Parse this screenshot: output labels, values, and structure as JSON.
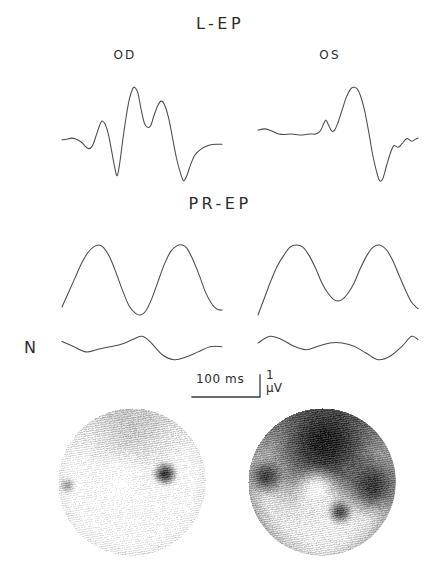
{
  "figure": {
    "sections": {
      "lep_title": "L-EP",
      "prep_title": "PR-EP",
      "noise_label": "N"
    },
    "eye_labels": {
      "right_eye": "OD",
      "left_eye": "OS"
    },
    "scale_bar": {
      "time_label": "100 ms",
      "amplitude_value": "1",
      "amplitude_unit": "µV"
    },
    "colors": {
      "trace": "#4a4a4a",
      "text": "#2b2b2b",
      "map_dark": "#111111",
      "map_light": "#f2f2f2"
    }
  },
  "chart_data": {
    "type": "line",
    "xlabel": "time",
    "ylabel": "amplitude",
    "axis_scale": {
      "time_per_bar_ms": 100,
      "amplitude_per_bar_uv": 1,
      "grid": false,
      "legend": false
    },
    "panels": [
      {
        "row": "L-EP",
        "eye": "OD",
        "description": "Large biphasic response with prominent positive peaks and deep negative troughs",
        "points": [
          [
            0,
            0.1
          ],
          [
            6,
            0.12
          ],
          [
            12,
            0.16
          ],
          [
            18,
            0.12
          ],
          [
            24,
            0.02
          ],
          [
            28,
            -0.1
          ],
          [
            33,
            -0.22
          ],
          [
            38,
            -0.12
          ],
          [
            43,
            0.28
          ],
          [
            47,
            0.62
          ],
          [
            50,
            0.78
          ],
          [
            54,
            0.66
          ],
          [
            58,
            0.3
          ],
          [
            62,
            -0.3
          ],
          [
            66,
            -0.92
          ],
          [
            69,
            -1.2
          ],
          [
            72,
            -0.78
          ],
          [
            76,
            0.1
          ],
          [
            80,
            0.9
          ],
          [
            84,
            1.55
          ],
          [
            88,
            1.92
          ],
          [
            91,
            2.0
          ],
          [
            95,
            1.78
          ],
          [
            99,
            1.18
          ],
          [
            103,
            0.7
          ],
          [
            107,
            0.55
          ],
          [
            111,
            0.62
          ],
          [
            115,
            0.98
          ],
          [
            120,
            1.35
          ],
          [
            124,
            1.5
          ],
          [
            128,
            1.38
          ],
          [
            133,
            0.92
          ],
          [
            138,
            0.2
          ],
          [
            143,
            -0.55
          ],
          [
            148,
            -1.1
          ],
          [
            152,
            -1.38
          ],
          [
            156,
            -1.2
          ],
          [
            161,
            -0.78
          ],
          [
            166,
            -0.46
          ],
          [
            172,
            -0.28
          ],
          [
            178,
            -0.16
          ],
          [
            186,
            -0.08
          ],
          [
            194,
            -0.06
          ],
          [
            200,
            -0.06
          ]
        ]
      },
      {
        "row": "L-EP",
        "eye": "OS",
        "description": "Attenuated and delayed response: flat early segment, small notch, single broad positive peak then deep negative trough",
        "points": [
          [
            0,
            0.06
          ],
          [
            8,
            0.1
          ],
          [
            14,
            0.06
          ],
          [
            20,
            -0.02
          ],
          [
            26,
            -0.1
          ],
          [
            33,
            -0.12
          ],
          [
            40,
            -0.1
          ],
          [
            47,
            -0.12
          ],
          [
            54,
            -0.14
          ],
          [
            60,
            -0.12
          ],
          [
            66,
            -0.1
          ],
          [
            72,
            -0.1
          ],
          [
            78,
            0.02
          ],
          [
            82,
            0.3
          ],
          [
            85,
            0.44
          ],
          [
            88,
            0.26
          ],
          [
            92,
            0.02
          ],
          [
            96,
            0.06
          ],
          [
            100,
            0.35
          ],
          [
            105,
            0.82
          ],
          [
            110,
            1.3
          ],
          [
            115,
            1.62
          ],
          [
            119,
            1.72
          ],
          [
            124,
            1.66
          ],
          [
            128,
            1.4
          ],
          [
            133,
            0.85
          ],
          [
            138,
            0.05
          ],
          [
            143,
            -0.85
          ],
          [
            148,
            -1.55
          ],
          [
            152,
            -1.92
          ],
          [
            156,
            -1.84
          ],
          [
            161,
            -1.3
          ],
          [
            166,
            -0.8
          ],
          [
            170,
            -0.55
          ],
          [
            175,
            -0.62
          ],
          [
            180,
            -0.48
          ],
          [
            186,
            -0.28
          ],
          [
            192,
            -0.38
          ],
          [
            197,
            -0.3
          ],
          [
            200,
            -0.26
          ]
        ]
      },
      {
        "row": "PR-EP",
        "eye": "OD",
        "description": "Large amplitude sinusoidal response with two well-formed positive peaks",
        "points": [
          [
            0,
            -0.85
          ],
          [
            8,
            -0.4
          ],
          [
            16,
            0.05
          ],
          [
            24,
            0.5
          ],
          [
            32,
            0.85
          ],
          [
            40,
            1.05
          ],
          [
            46,
            1.1
          ],
          [
            52,
            1.02
          ],
          [
            60,
            0.7
          ],
          [
            68,
            0.2
          ],
          [
            76,
            -0.35
          ],
          [
            84,
            -0.82
          ],
          [
            92,
            -1.05
          ],
          [
            98,
            -1.1
          ],
          [
            104,
            -1.0
          ],
          [
            112,
            -0.6
          ],
          [
            120,
            -0.05
          ],
          [
            128,
            0.5
          ],
          [
            136,
            0.9
          ],
          [
            144,
            1.08
          ],
          [
            150,
            1.1
          ],
          [
            156,
            1.0
          ],
          [
            164,
            0.62
          ],
          [
            172,
            0.12
          ],
          [
            180,
            -0.42
          ],
          [
            188,
            -0.78
          ],
          [
            194,
            -0.92
          ],
          [
            200,
            -0.95
          ]
        ]
      },
      {
        "row": "PR-EP",
        "eye": "OS",
        "description": "Markedly reduced amplitude, flattened double-hump waveform",
        "points": [
          [
            0,
            -0.52
          ],
          [
            8,
            -0.36
          ],
          [
            16,
            -0.2
          ],
          [
            24,
            -0.06
          ],
          [
            32,
            0.04
          ],
          [
            40,
            0.12
          ],
          [
            48,
            0.14
          ],
          [
            56,
            0.12
          ],
          [
            64,
            0.04
          ],
          [
            72,
            -0.08
          ],
          [
            80,
            -0.22
          ],
          [
            88,
            -0.32
          ],
          [
            96,
            -0.38
          ],
          [
            104,
            -0.38
          ],
          [
            112,
            -0.32
          ],
          [
            120,
            -0.22
          ],
          [
            128,
            -0.08
          ],
          [
            136,
            0.04
          ],
          [
            144,
            0.12
          ],
          [
            152,
            0.14
          ],
          [
            160,
            0.1
          ],
          [
            168,
            0.0
          ],
          [
            176,
            -0.14
          ],
          [
            184,
            -0.28
          ],
          [
            192,
            -0.4
          ],
          [
            200,
            -0.46
          ]
        ]
      },
      {
        "row": "N",
        "eye": "OD",
        "description": "Noise baseline, essentially flat",
        "points": [
          [
            0,
            0.04
          ],
          [
            15,
            0.02
          ],
          [
            30,
            0.0
          ],
          [
            45,
            0.01
          ],
          [
            60,
            0.02
          ],
          [
            75,
            0.03
          ],
          [
            90,
            0.05
          ],
          [
            100,
            0.06
          ],
          [
            110,
            0.04
          ],
          [
            125,
            -0.01
          ],
          [
            140,
            -0.03
          ],
          [
            155,
            -0.02
          ],
          [
            170,
            0.0
          ],
          [
            185,
            0.02
          ],
          [
            200,
            0.02
          ]
        ]
      },
      {
        "row": "N",
        "eye": "OS",
        "description": "Noise baseline, essentially flat",
        "points": [
          [
            0,
            0.02
          ],
          [
            15,
            0.04
          ],
          [
            30,
            0.03
          ],
          [
            45,
            0.01
          ],
          [
            60,
            0.0
          ],
          [
            75,
            0.01
          ],
          [
            90,
            0.02
          ],
          [
            105,
            0.02
          ],
          [
            120,
            0.01
          ],
          [
            135,
            -0.01
          ],
          [
            150,
            -0.03
          ],
          [
            165,
            -0.02
          ],
          [
            180,
            0.01
          ],
          [
            192,
            0.04
          ],
          [
            200,
            0.03
          ]
        ]
      }
    ],
    "field_maps": [
      {
        "eye": "OD",
        "type": "heatmap",
        "shape": "circular",
        "description": "Mostly light/preserved field with fine dither; discrete dark blind spot in the temporal (right) mid-periphery and mild darkening along the superior and outer rim",
        "overall_darkness": 0.22,
        "features": [
          {
            "name": "blind-spot",
            "x_pct": 72,
            "y_pct": 44,
            "radius_pct": 9,
            "darkness": 0.95
          },
          {
            "name": "superior-rim-shading",
            "x_pct": 50,
            "y_pct": 6,
            "radius_pct": 46,
            "darkness": 0.3
          },
          {
            "name": "nasal-edge-speck",
            "x_pct": 6,
            "y_pct": 52,
            "radius_pct": 6,
            "darkness": 0.45
          },
          {
            "name": "central-clear-zone",
            "x_pct": 42,
            "y_pct": 50,
            "radius_pct": 22,
            "darkness": 0.02
          }
        ]
      },
      {
        "eye": "OS",
        "type": "heatmap",
        "shape": "circular",
        "description": "Dense dark defect occupying the entire superior half of the field with an inferior island of preserved sensitivity; severe altitudinal field loss",
        "overall_darkness": 0.62,
        "features": [
          {
            "name": "superior-altitudinal-defect",
            "x_pct": 52,
            "y_pct": 22,
            "radius_pct": 52,
            "darkness": 0.97
          },
          {
            "name": "temporal-extension",
            "x_pct": 84,
            "y_pct": 52,
            "radius_pct": 22,
            "darkness": 0.88
          },
          {
            "name": "nasal-wedge",
            "x_pct": 12,
            "y_pct": 46,
            "radius_pct": 13,
            "darkness": 0.85
          },
          {
            "name": "central-preserved-island",
            "x_pct": 46,
            "y_pct": 56,
            "radius_pct": 17,
            "darkness": 0.03
          },
          {
            "name": "inferior-preserved-field",
            "x_pct": 50,
            "y_pct": 82,
            "radius_pct": 34,
            "darkness": 0.12
          },
          {
            "name": "inferior-dark-notch",
            "x_pct": 62,
            "y_pct": 70,
            "radius_pct": 9,
            "darkness": 0.8
          }
        ]
      }
    ]
  }
}
